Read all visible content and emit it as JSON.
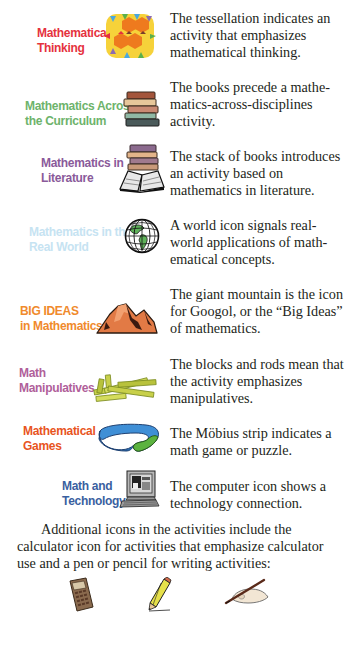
{
  "entries": [
    {
      "label_line1": "Mathematical",
      "label_line2": "Thinking",
      "label_color": "#e5323e",
      "icon": "tessellation-icon",
      "description": "The tessellation indicates an activity that emphasizes mathematical thinking."
    },
    {
      "label_line1": "Mathematics Across",
      "label_line2": "the Curriculum",
      "label_color": "#6db36b",
      "icon": "books-icon",
      "description": "The books precede a mathe­matics-across-disciplines activity."
    },
    {
      "label_line1": "Mathematics in",
      "label_line2": "Literature",
      "label_color": "#8a5a9a",
      "icon": "books-open-book-icon",
      "description": "The stack of books intro­duces an activity based on mathematics in literature."
    },
    {
      "label_line1": "Mathematics in the",
      "label_line2": "Real World",
      "label_color": "#c6e3f2",
      "icon": "globe-icon",
      "description": "A world icon signals real-world applications of math­ematical concepts."
    },
    {
      "label_line1": "BIG IDEAS",
      "label_line2": "in Mathematics",
      "label_color": "#f08a2c",
      "icon": "mountain-icon",
      "description": "The giant mountain is the icon for Googol, or the “Big Ideas” of mathematics."
    },
    {
      "label_line1": "Math",
      "label_line2": "Manipulatives",
      "label_color": "#b0609a",
      "icon": "blocks-rods-icon",
      "description": "The blocks and rods mean that the activity emphasizes manipulatives."
    },
    {
      "label_line1": "Mathematical",
      "label_line2": "Games",
      "label_color": "#e8541e",
      "icon": "mobius-strip-icon",
      "description": "The Möbius strip indicates a math game or puzzle."
    },
    {
      "label_line1": "Math and",
      "label_line2": "Technology",
      "label_color": "#3a5fa0",
      "icon": "computer-icon",
      "description": "The computer icon shows a technology connection."
    }
  ],
  "additional_paragraph": "Additional icons in the activities include the calcula­tor icon for activities that emphasize calculator use and a pen or pencil for writing activities:",
  "bottom_icons": [
    "calculator-icon",
    "pencil-icon",
    "hand-writing-pen-icon"
  ]
}
